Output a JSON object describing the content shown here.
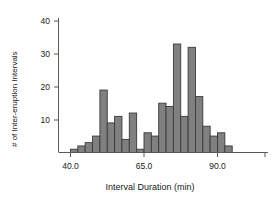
{
  "chart_data": {
    "type": "bar",
    "title": "",
    "subtitle": "",
    "xlabel": "Interval Duration (min)",
    "ylabel": "# of Inter-eruption Intervals",
    "xlim": [
      38.0,
      96.0
    ],
    "ylim": [
      0,
      42
    ],
    "grid": false,
    "legend": null,
    "bin_width": 2.5,
    "x_tick_labels": [
      "40.0",
      "65.0",
      "90.0"
    ],
    "x_tick_values": [
      40.0,
      65.0,
      90.0
    ],
    "y_tick_labels": [
      "10",
      "20",
      "30",
      "40"
    ],
    "y_tick_values": [
      10,
      20,
      30,
      40
    ],
    "bar_color": "#808080",
    "bar_edge_color": "#3a3a3a",
    "axis_color": "#595959",
    "categories": [
      "40.0",
      "42.5",
      "45.0",
      "47.5",
      "50.0",
      "52.5",
      "55.0",
      "57.5",
      "60.0",
      "62.5",
      "65.0",
      "67.5",
      "70.0",
      "72.5",
      "75.0",
      "77.5",
      "80.0",
      "82.5",
      "85.0",
      "87.5",
      "90.0",
      "92.5"
    ],
    "bin_starts": [
      40.0,
      42.5,
      45.0,
      47.5,
      50.0,
      52.5,
      55.0,
      57.5,
      60.0,
      62.5,
      65.0,
      67.5,
      70.0,
      72.5,
      75.0,
      77.5,
      80.0,
      82.5,
      85.0,
      87.5,
      90.0,
      92.5
    ],
    "values": [
      1,
      2,
      3,
      5,
      19,
      9,
      11,
      4,
      12,
      1,
      6,
      5,
      15,
      14,
      33,
      11,
      32,
      17,
      8,
      5,
      6,
      2
    ]
  }
}
